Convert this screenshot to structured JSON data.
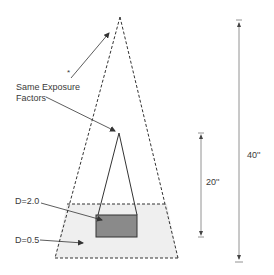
{
  "diagram": {
    "labels": {
      "same_exposure_line1": "Same Exposure",
      "same_exposure_line2": "Factors",
      "asterisk": "*",
      "density_high": "D=2.0",
      "density_low": "D=0.5",
      "distance_short": "20''",
      "distance_long": "40''"
    },
    "colors": {
      "line": "#333333",
      "dark_object_fill": "#8a8a8a",
      "light_field_fill": "#efefef",
      "dimension_line": "#777777"
    },
    "geometry": {
      "outer_cone": {
        "apex": [
          120,
          17
        ],
        "base_left": [
          55,
          258
        ],
        "base_right": [
          178,
          258
        ],
        "style": "dashed"
      },
      "inner_cone": {
        "apex": [
          119,
          133
        ],
        "base_left": [
          98,
          215
        ],
        "base_right": [
          137,
          215
        ],
        "style": "solid"
      },
      "field_region": {
        "top_y": 204,
        "bottom_y": 258,
        "style": "dashed"
      },
      "dense_object": {
        "x": 96,
        "y": 215,
        "w": 41,
        "h": 22
      },
      "dim_20": {
        "x": 201,
        "y1": 133,
        "y2": 237
      },
      "dim_40": {
        "x": 239,
        "y1": 20,
        "y2": 262
      }
    }
  }
}
